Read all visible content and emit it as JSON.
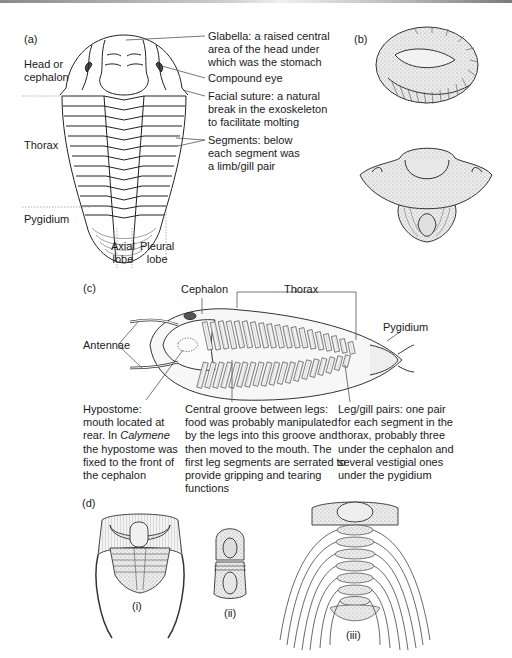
{
  "figure": {
    "panels": {
      "a": {
        "tag": "(a)",
        "regions": {
          "head": [
            "Head or",
            "cephalon"
          ],
          "thorax": "Thorax",
          "pygidium": "Pygidium"
        },
        "lobes": {
          "axial": [
            "Axial",
            "lobe"
          ],
          "pleural": [
            "Pleural",
            "lobe"
          ]
        },
        "callouts": {
          "glabella": [
            "Glabella: a raised central",
            "area of the head under",
            "which was the stomach"
          ],
          "eye": "Compound eye",
          "suture": [
            "Facial suture: a natural",
            "break in the exoskeleton",
            "to facilitate molting"
          ],
          "segments": [
            "Segments: below",
            "each segment was",
            "a limb/gill pair"
          ]
        }
      },
      "b": {
        "tag": "(b)"
      },
      "c": {
        "tag": "(c)",
        "labels": {
          "cephalon": "Cephalon",
          "thorax": "Thorax",
          "pygidium": "Pygidium",
          "antennae": "Antennae"
        },
        "notes": {
          "hypostome": {
            "line1": "Hypostome:",
            "line2": "mouth located at",
            "line3_pre": "rear. In ",
            "line3_em": "Calymene",
            "line4": "the hypostome was",
            "line5": "fixed to the front of",
            "line6": "the cephalon"
          },
          "groove": [
            "Central groove between legs:",
            "food was probably manipulated",
            "by the legs into this groove and",
            "then moved to the mouth. The",
            "first leg segments are serrated to",
            "provide gripping and tearing",
            "functions"
          ],
          "legs": [
            "Leg/gill pairs: one pair",
            "for each segment in the",
            "thorax, probably three",
            "under the cephalon and",
            "several vestigial ones",
            "under the pygidium"
          ]
        }
      },
      "d": {
        "tag": "(d)",
        "sub": [
          "(i)",
          "(ii)",
          "(iii)"
        ]
      }
    },
    "colors": {
      "ink": "#1a1a1a",
      "shade": "#cfcfcf",
      "eye": "#4a4a4a",
      "leader": "#555555"
    }
  }
}
